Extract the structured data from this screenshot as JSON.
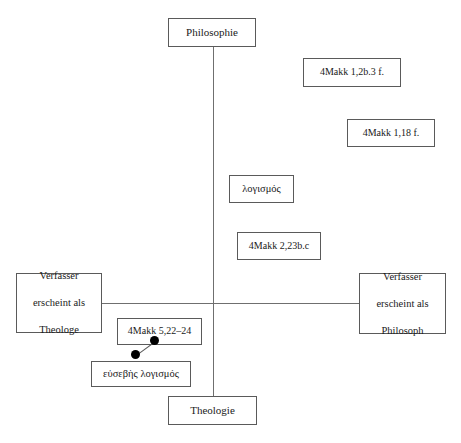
{
  "diagram": {
    "background_color": "#ffffff",
    "line_color": "#6f6f6f",
    "box_border_color": "#5a5a5a",
    "text_color": "#1a1a1a",
    "dot_color": "#000000",
    "axes": {
      "vertical": {
        "top_label": "Philosophie",
        "bottom_label": "Theologie",
        "x": 213,
        "y_top": 47,
        "y_bottom": 396
      },
      "horizontal": {
        "left_label": "Verfasser erscheint als Theologe",
        "right_label": "Verfasser erscheint als Philosoph",
        "y": 303,
        "x_left": 102,
        "x_right": 359
      },
      "origin": {
        "x": 213,
        "y": 303
      }
    },
    "nodes": {
      "philosophie": {
        "label": "Philosophie"
      },
      "theologie": {
        "label": "Theologie"
      },
      "verfasser_theologe": {
        "line1": "Verfasser",
        "line2": "erscheint als",
        "line3": "Theologe"
      },
      "verfasser_philosoph": {
        "line1": "Verfasser",
        "line2": "erscheint als",
        "line3": "Philosoph"
      },
      "ref_1_2b_3": {
        "label": "4Makk 1,2b.3 f."
      },
      "ref_1_18": {
        "label": "4Makk 1,18 f."
      },
      "logismos": {
        "label": "λογισμός"
      },
      "ref_2_23bc": {
        "label": "4Makk 2,23b.c"
      },
      "ref_5_22_24": {
        "label": "4Makk 5,22–24"
      },
      "eusebes_logismos": {
        "label": "εὐσεβὴς λογισμός"
      }
    },
    "connector": {
      "from_node": "ref_5_22_24",
      "to_node": "eusebes_logismos",
      "dot_upper": {
        "x": 154,
        "y": 340
      },
      "dot_lower": {
        "x": 135,
        "y": 354
      }
    }
  }
}
